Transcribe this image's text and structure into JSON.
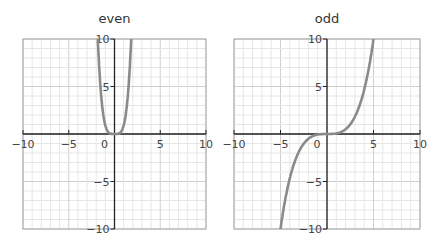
{
  "chart_data": [
    {
      "type": "line",
      "title": "even",
      "xlabel": "",
      "ylabel": "",
      "xlim": [
        -10,
        10
      ],
      "ylim": [
        -10,
        10
      ],
      "grid": true,
      "x_ticks": [
        "-10",
        "-5",
        "0",
        "5",
        "10"
      ],
      "y_ticks": [
        "10",
        "5",
        "-5",
        "-10"
      ],
      "series": [
        {
          "name": "even function",
          "x": [
            -1.8,
            -1.5,
            -1.2,
            -0.9,
            -0.6,
            -0.3,
            0,
            0.3,
            0.6,
            0.9,
            1.2,
            1.5,
            1.8
          ],
          "values": [
            10.5,
            5.06,
            2.07,
            0.66,
            0.13,
            0.01,
            0,
            0.01,
            0.13,
            0.66,
            2.07,
            5.06,
            10.5
          ]
        }
      ]
    },
    {
      "type": "line",
      "title": "odd",
      "xlabel": "",
      "ylabel": "",
      "xlim": [
        -10,
        10
      ],
      "ylim": [
        -10,
        10
      ],
      "grid": true,
      "x_ticks": [
        "-10",
        "-5",
        "0",
        "5",
        "10"
      ],
      "y_ticks": [
        "10",
        "5",
        "-5",
        "-10"
      ],
      "series": [
        {
          "name": "odd function",
          "x": [
            -5.1,
            -4.5,
            -4,
            -3,
            -2,
            -1,
            0,
            1,
            2,
            3,
            4,
            4.5,
            5.1
          ],
          "values": [
            -10,
            -6.9,
            -4.8,
            -2.0,
            -0.6,
            -0.08,
            0,
            0.08,
            0.6,
            2.0,
            4.8,
            6.9,
            10
          ]
        }
      ]
    }
  ],
  "titles": {
    "left": "even",
    "right": "odd"
  }
}
